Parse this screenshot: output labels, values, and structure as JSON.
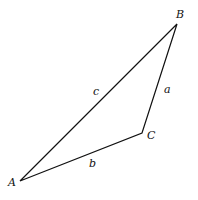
{
  "diagram": {
    "type": "triangle",
    "vertices": [
      {
        "name": "A",
        "x": 20,
        "y": 181
      },
      {
        "name": "B",
        "x": 177,
        "y": 24
      },
      {
        "name": "C",
        "x": 142,
        "y": 133
      }
    ],
    "sides": [
      {
        "name": "a",
        "from": "B",
        "to": "C"
      },
      {
        "name": "b",
        "from": "C",
        "to": "A"
      },
      {
        "name": "c",
        "from": "A",
        "to": "B"
      }
    ],
    "labels": {
      "A": "A",
      "B": "B",
      "C": "C",
      "a": "a",
      "b": "b",
      "c": "c"
    },
    "stroke_color": "#111111"
  }
}
